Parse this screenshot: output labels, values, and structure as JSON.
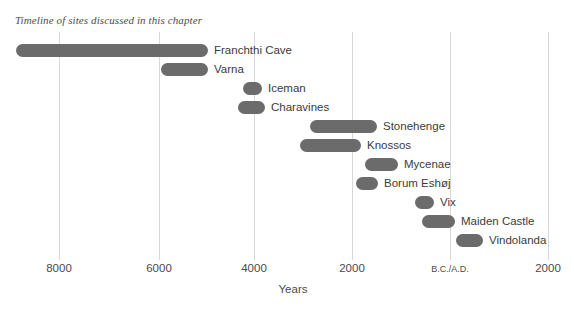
{
  "chart_data": {
    "type": "bar",
    "title": "Timeline of sites discussed in this chapter",
    "xlabel": "Years",
    "ylabel": "",
    "orientation": "horizontal",
    "bar_style": "range",
    "grid": true,
    "grid_axis": "x",
    "legend": "none",
    "axis": {
      "xlim": [
        -9500,
        2500
      ],
      "era_note": "Values are years B.C. (negative) through A.D. (positive); B.C./A.D. is year 0",
      "ticks": [
        {
          "value": -8000,
          "label": "8000",
          "x_px": 59
        },
        {
          "value": -6000,
          "label": "6000",
          "x_px": 159
        },
        {
          "value": -4000,
          "label": "4000",
          "x_px": 254
        },
        {
          "value": -2000,
          "label": "2000",
          "x_px": 352
        },
        {
          "value": 0,
          "label": "B.C./A.D.",
          "x_px": 450
        },
        {
          "value": 2000,
          "label": "2000",
          "x_px": 548
        }
      ]
    },
    "categories": [
      "Franchthi Cave",
      "Varna",
      "Iceman",
      "Charavines",
      "Stonehenge",
      "Knossos",
      "Mycenae",
      "Borum Eshøj",
      "Vix",
      "Maiden Castle",
      "Vindolanda"
    ],
    "bars": [
      {
        "label": "Franchthi Cave",
        "start": -8900,
        "end": -5000,
        "x_px": 16,
        "w_px": 192,
        "y_px": 44
      },
      {
        "label": "Varna",
        "start": -5950,
        "end": -5000,
        "x_px": 161,
        "w_px": 47,
        "y_px": 63
      },
      {
        "label": "Iceman",
        "start": -4250,
        "end": -3850,
        "x_px": 243,
        "w_px": 19,
        "y_px": 82
      },
      {
        "label": "Charavines",
        "start": -4350,
        "end": -3800,
        "x_px": 238,
        "w_px": 27,
        "y_px": 101
      },
      {
        "label": "Stonehenge",
        "start": -2900,
        "end": -1550,
        "x_px": 310,
        "w_px": 67,
        "y_px": 120
      },
      {
        "label": "Knossos",
        "start": -3100,
        "end": -1850,
        "x_px": 300,
        "w_px": 61,
        "y_px": 139
      },
      {
        "label": "Mycenae",
        "start": -1750,
        "end": -1080,
        "x_px": 365,
        "w_px": 33,
        "y_px": 158
      },
      {
        "label": "Borum Eshøj",
        "start": -1930,
        "end": -1480,
        "x_px": 356,
        "w_px": 22,
        "y_px": 177
      },
      {
        "label": "Vix",
        "start": -720,
        "end": -330,
        "x_px": 415,
        "w_px": 19,
        "y_px": 196
      },
      {
        "label": "Maiden Castle",
        "start": -580,
        "end": 100,
        "x_px": 422,
        "w_px": 33,
        "y_px": 215
      },
      {
        "label": "Vindolanda",
        "start": 120,
        "end": 670,
        "x_px": 456,
        "w_px": 27,
        "y_px": 234
      }
    ],
    "colors": {
      "bar": "#6b6b6b",
      "gridline": "#d8d8d8",
      "label_text": "#3b3b3b",
      "tick_text": "#4a4a4a",
      "title_text": "#4c4c4c",
      "background": "#ffffff"
    }
  }
}
